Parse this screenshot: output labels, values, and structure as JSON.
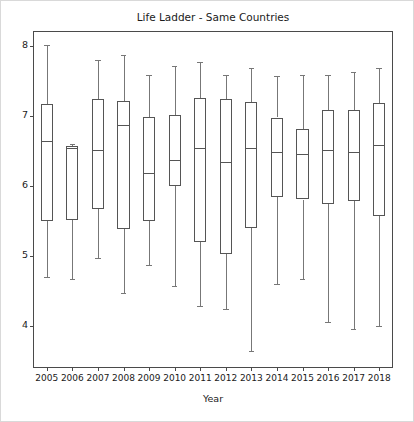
{
  "figure": {
    "title": "Life Ladder - Same Countries",
    "xlabel": "Year",
    "ylabel": ""
  },
  "chart_data": {
    "type": "box",
    "title": "Life Ladder - Same Countries",
    "xlabel": "Year",
    "ylabel": "",
    "ylim": [
      3.42,
      8.2
    ],
    "yticks": [
      4,
      5,
      6,
      7,
      8
    ],
    "ytick_labels": [
      "4",
      "5",
      "6",
      "7",
      "8"
    ],
    "grid": false,
    "legend": false,
    "categories": [
      "2005",
      "2006",
      "2007",
      "2008",
      "2009",
      "2010",
      "2011",
      "2012",
      "2013",
      "2014",
      "2015",
      "2016",
      "2017",
      "2018"
    ],
    "boxes": [
      {
        "category": "2005",
        "whisker_low": 4.71,
        "q1": 5.51,
        "median": 6.64,
        "q3": 7.17,
        "whisker_high": 8.01
      },
      {
        "category": "2006",
        "whisker_low": 4.67,
        "q1": 5.52,
        "median": 6.54,
        "q3": 6.57,
        "whisker_high": 6.6
      },
      {
        "category": "2007",
        "whisker_low": 4.98,
        "q1": 5.67,
        "median": 6.52,
        "q3": 7.25,
        "whisker_high": 7.8
      },
      {
        "category": "2008",
        "whisker_low": 4.48,
        "q1": 5.39,
        "median": 6.88,
        "q3": 7.22,
        "whisker_high": 7.87
      },
      {
        "category": "2009",
        "whisker_low": 4.88,
        "q1": 5.51,
        "median": 6.19,
        "q3": 6.99,
        "whisker_high": 7.58
      },
      {
        "category": "2010",
        "whisker_low": 4.57,
        "q1": 6.0,
        "median": 6.38,
        "q3": 7.01,
        "whisker_high": 7.72
      },
      {
        "category": "2011",
        "whisker_low": 4.29,
        "q1": 5.21,
        "median": 6.54,
        "q3": 7.26,
        "whisker_high": 7.77
      },
      {
        "category": "2012",
        "whisker_low": 4.25,
        "q1": 5.03,
        "median": 6.35,
        "q3": 7.25,
        "whisker_high": 7.58
      },
      {
        "category": "2013",
        "whisker_low": 3.65,
        "q1": 5.4,
        "median": 6.55,
        "q3": 7.2,
        "whisker_high": 7.68
      },
      {
        "category": "2014",
        "whisker_low": 4.6,
        "q1": 5.84,
        "median": 6.49,
        "q3": 6.98,
        "whisker_high": 7.57
      },
      {
        "category": "2015",
        "whisker_low": 4.67,
        "q1": 5.81,
        "median": 6.46,
        "q3": 6.81,
        "whisker_high": 7.58
      },
      {
        "category": "2016",
        "whisker_low": 4.06,
        "q1": 5.75,
        "median": 6.52,
        "q3": 7.08,
        "whisker_high": 7.58
      },
      {
        "category": "2017",
        "whisker_low": 3.96,
        "q1": 5.79,
        "median": 6.49,
        "q3": 7.08,
        "whisker_high": 7.63
      },
      {
        "category": "2018",
        "whisker_low": 4.01,
        "q1": 5.58,
        "median": 6.59,
        "q3": 7.18,
        "whisker_high": 7.69
      }
    ]
  }
}
